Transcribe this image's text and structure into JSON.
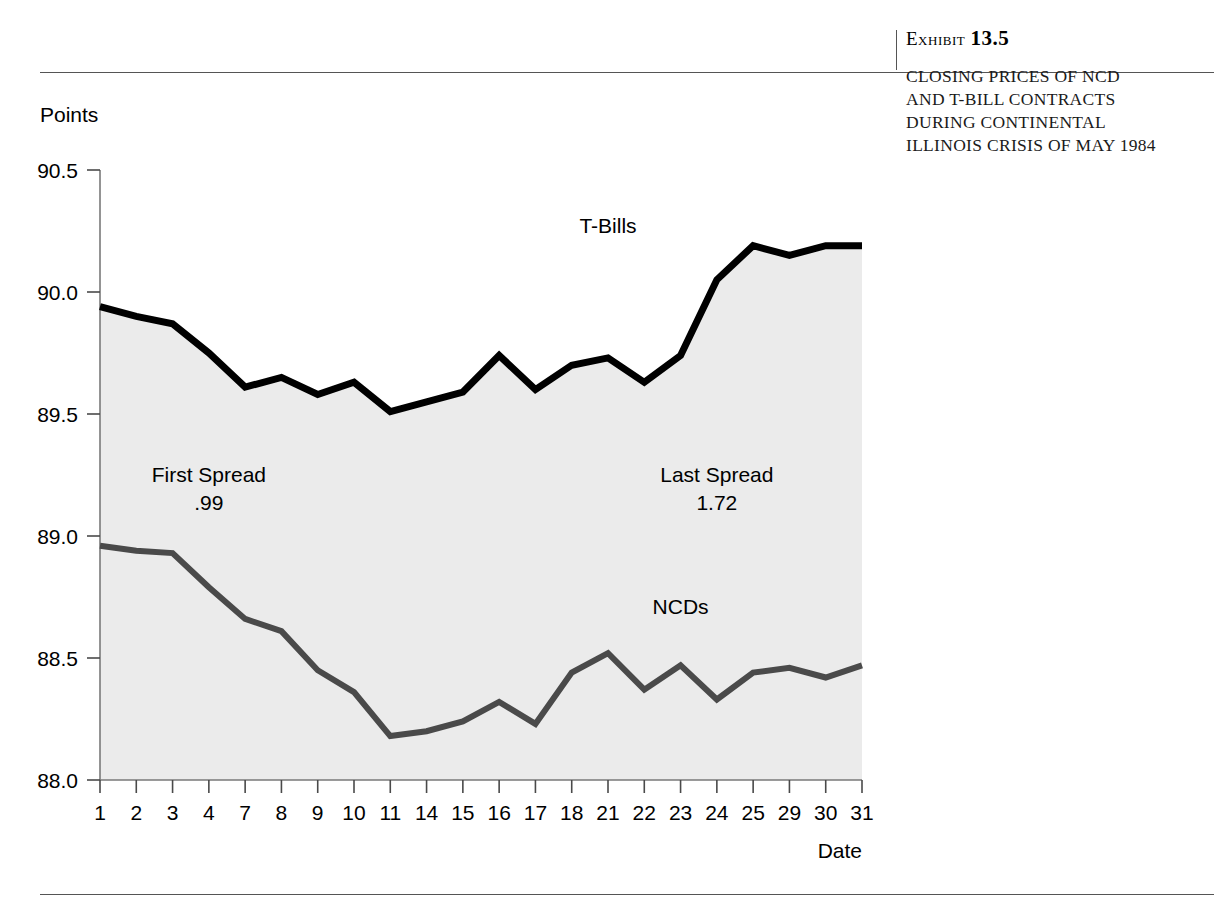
{
  "exhibit": {
    "label": "Exhibit",
    "number": "13.5",
    "caption": "Closing Prices of NCD and T-Bill Contracts During Continental Illinois Crisis of May 1984"
  },
  "chart_data": {
    "type": "line",
    "title": "",
    "xlabel": "Date",
    "ylabel": "Points",
    "ylim": [
      88.0,
      90.5
    ],
    "yticks": [
      "88.0",
      "88.5",
      "89.0",
      "89.5",
      "90.0",
      "90.5"
    ],
    "ytick_values": [
      88.0,
      88.5,
      89.0,
      89.5,
      90.0,
      90.5
    ],
    "grid": false,
    "legend_position": "inline-labels",
    "categories": [
      "1",
      "2",
      "3",
      "4",
      "7",
      "8",
      "9",
      "10",
      "11",
      "14",
      "15",
      "16",
      "17",
      "18",
      "21",
      "22",
      "23",
      "24",
      "25",
      "29",
      "30",
      "31"
    ],
    "series": [
      {
        "name": "T-Bills",
        "color": "#000000",
        "values": [
          89.94,
          89.9,
          89.87,
          89.75,
          89.61,
          89.65,
          89.58,
          89.63,
          89.51,
          89.55,
          89.59,
          89.74,
          89.6,
          89.7,
          89.73,
          89.63,
          89.74,
          90.05,
          90.19,
          90.15,
          90.19,
          90.19
        ]
      },
      {
        "name": "NCDs",
        "color": "#4a4a4a",
        "values": [
          88.96,
          88.94,
          88.93,
          88.79,
          88.66,
          88.61,
          88.45,
          88.36,
          88.18,
          88.2,
          88.24,
          88.32,
          88.23,
          88.44,
          88.52,
          88.37,
          88.47,
          88.33,
          88.44,
          88.46,
          88.42,
          88.47
        ]
      }
    ],
    "annotations": [
      {
        "name": "first-spread",
        "line1": "First Spread",
        "line2": ".99",
        "x_category": "4",
        "y_value": 89.22
      },
      {
        "name": "last-spread",
        "line1": "Last Spread",
        "line2": "1.72",
        "x_category": "24",
        "y_value": 89.22
      }
    ],
    "series_labels": [
      {
        "name": "T-Bills",
        "x_category": "21",
        "y_value": 90.24
      },
      {
        "name": "NCDs",
        "x_category": "23",
        "y_value": 88.68
      }
    ],
    "fill_color": "#ebebeb",
    "plot_background": "#ffffff"
  }
}
